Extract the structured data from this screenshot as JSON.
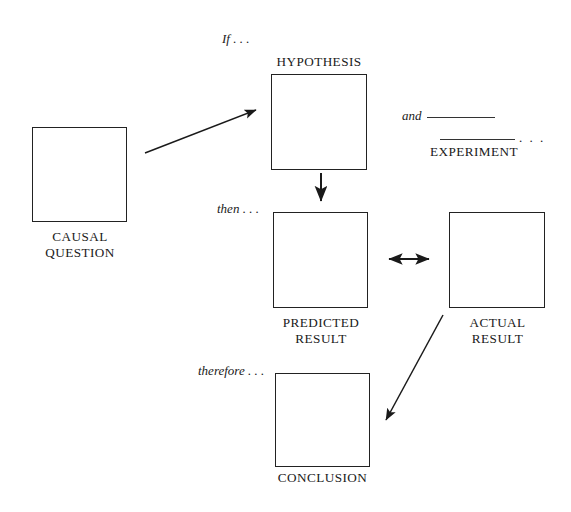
{
  "diagram": {
    "background_color": "#ffffff",
    "line_color": "#222222",
    "text_color": "#1a1a1a",
    "width": 571,
    "height": 512,
    "nodes": [
      {
        "id": "causal-question",
        "label": "CAUSAL\nQUESTION",
        "x": 32,
        "y": 127,
        "width": 95,
        "height": 95,
        "label_x": 29,
        "label_y": 229,
        "label_width": 102
      },
      {
        "id": "hypothesis",
        "label": "HYPOTHESIS",
        "x": 271,
        "y": 74,
        "width": 96,
        "height": 96,
        "label_x": 262,
        "label_y": 54,
        "label_width": 114
      },
      {
        "id": "predicted-result",
        "label": "PREDICTED\nRESULT",
        "x": 273,
        "y": 212,
        "width": 95,
        "height": 96,
        "label_x": 269,
        "label_y": 315,
        "label_width": 104
      },
      {
        "id": "actual-result",
        "label": "ACTUAL\nRESULT",
        "x": 449,
        "y": 212,
        "width": 96,
        "height": 96,
        "label_x": 451,
        "label_y": 315,
        "label_width": 93
      },
      {
        "id": "conclusion",
        "label": "CONCLUSION",
        "x": 275,
        "y": 373,
        "width": 95,
        "height": 94,
        "label_x": 262,
        "label_y": 470,
        "label_width": 121
      }
    ],
    "connector_labels": [
      {
        "id": "if",
        "text": "If . . .",
        "x": 222,
        "y": 31
      },
      {
        "id": "then",
        "text": "then . . .",
        "x": 217,
        "y": 201
      },
      {
        "id": "therefore",
        "text": "therefore . . .",
        "x": 198,
        "y": 363
      }
    ],
    "experiment": {
      "and_label": "and",
      "trailing_dots": ". . .",
      "title": "EXPERIMENT"
    },
    "arrows": [
      {
        "id": "causal-question-to-hypothesis",
        "type": "single",
        "x1": 145,
        "y1": 153,
        "x2": 260,
        "y2": 109
      },
      {
        "id": "hypothesis-to-predicted-result",
        "type": "single",
        "x1": 321,
        "y1": 173,
        "x2": 321,
        "y2": 205
      },
      {
        "id": "predicted-vs-actual-result",
        "type": "double",
        "x1": 384,
        "y1": 259,
        "x2": 433,
        "y2": 259
      },
      {
        "id": "actual-result-to-conclusion",
        "type": "single",
        "x1": 443,
        "y1": 315,
        "x2": 383,
        "y2": 425
      }
    ]
  }
}
